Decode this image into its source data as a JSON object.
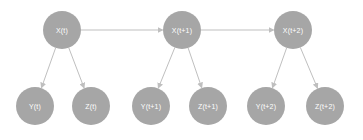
{
  "diagram": {
    "type": "dynamic-bayesian-network",
    "colors": {
      "background": "#ffffff",
      "node_fill": "#a6a6a6",
      "edge": "#bfbfbf",
      "label": "#ffffff"
    },
    "nodes": [
      {
        "id": "xt",
        "label": "X(t)",
        "cx": 62,
        "cy": 30,
        "r": 19
      },
      {
        "id": "xt1",
        "label": "X(t+1)",
        "cx": 182,
        "cy": 30,
        "r": 19
      },
      {
        "id": "xt2",
        "label": "X(t+2)",
        "cx": 293,
        "cy": 30,
        "r": 19
      },
      {
        "id": "yt",
        "label": "Y(t)",
        "cx": 35,
        "cy": 106,
        "r": 19
      },
      {
        "id": "zt",
        "label": "Z(t)",
        "cx": 91,
        "cy": 106,
        "r": 19
      },
      {
        "id": "yt1",
        "label": "Y(t+1)",
        "cx": 151,
        "cy": 106,
        "r": 19
      },
      {
        "id": "zt1",
        "label": "Z(t+1)",
        "cx": 208,
        "cy": 106,
        "r": 19
      },
      {
        "id": "yt2",
        "label": "Y(t+2)",
        "cx": 266,
        "cy": 106,
        "r": 19
      },
      {
        "id": "zt2",
        "label": "Z(t+2)",
        "cx": 325,
        "cy": 106,
        "r": 19
      }
    ],
    "edges": [
      {
        "from": "xt",
        "to": "xt1"
      },
      {
        "from": "xt1",
        "to": "xt2"
      },
      {
        "from": "xt",
        "to": "yt"
      },
      {
        "from": "xt",
        "to": "zt"
      },
      {
        "from": "xt1",
        "to": "yt1"
      },
      {
        "from": "xt1",
        "to": "zt1"
      },
      {
        "from": "xt2",
        "to": "yt2"
      },
      {
        "from": "xt2",
        "to": "zt2"
      }
    ]
  }
}
